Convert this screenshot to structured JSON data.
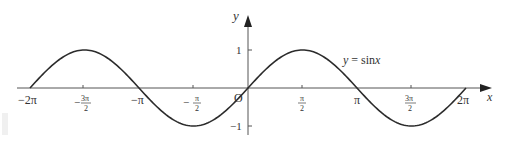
{
  "chart_data": {
    "type": "line",
    "title": "",
    "xlabel": "x",
    "ylabel": "y",
    "series": [
      {
        "name": "y = sinx",
        "function": "sin(x)",
        "x_range": [
          "-2π",
          "2π"
        ]
      }
    ],
    "x_ticks": [
      "−2π",
      "−3π/2",
      "−π",
      "−π/2",
      "π/2",
      "π",
      "3π/2",
      "2π"
    ],
    "x_tick_values": [
      -6.2832,
      -4.7124,
      -3.1416,
      -1.5708,
      1.5708,
      3.1416,
      4.7124,
      6.2832
    ],
    "y_ticks": [
      "1",
      "−1"
    ],
    "y_tick_values": [
      1,
      -1
    ],
    "origin_label": "O",
    "curve_label": "y = sinx",
    "xlim": [
      -6.8,
      7.0
    ],
    "ylim": [
      -1.3,
      1.6
    ],
    "grid": false,
    "legend": null,
    "sample_points": {
      "x": [
        -6.2832,
        -4.7124,
        -3.1416,
        -1.5708,
        0,
        1.5708,
        3.1416,
        4.7124,
        6.2832
      ],
      "y": [
        0,
        1,
        0,
        -1,
        0,
        1,
        0,
        -1,
        0
      ]
    }
  },
  "labels": {
    "x_axis": "x",
    "y_axis": "y",
    "origin": "O",
    "curve_y": "y",
    "curve_eq": " = sin",
    "curve_x": "x",
    "y_pos1": "1",
    "y_neg1": "−1",
    "neg2pi": "−2π",
    "negpi": "−π",
    "pi": "π",
    "twopi": "2π",
    "minus": "−",
    "pi_sym": "π",
    "three_pi": "3π",
    "two": "2"
  },
  "colors": {
    "curve": "#2b2b2b",
    "axis": "#555555",
    "text": "#333333"
  }
}
